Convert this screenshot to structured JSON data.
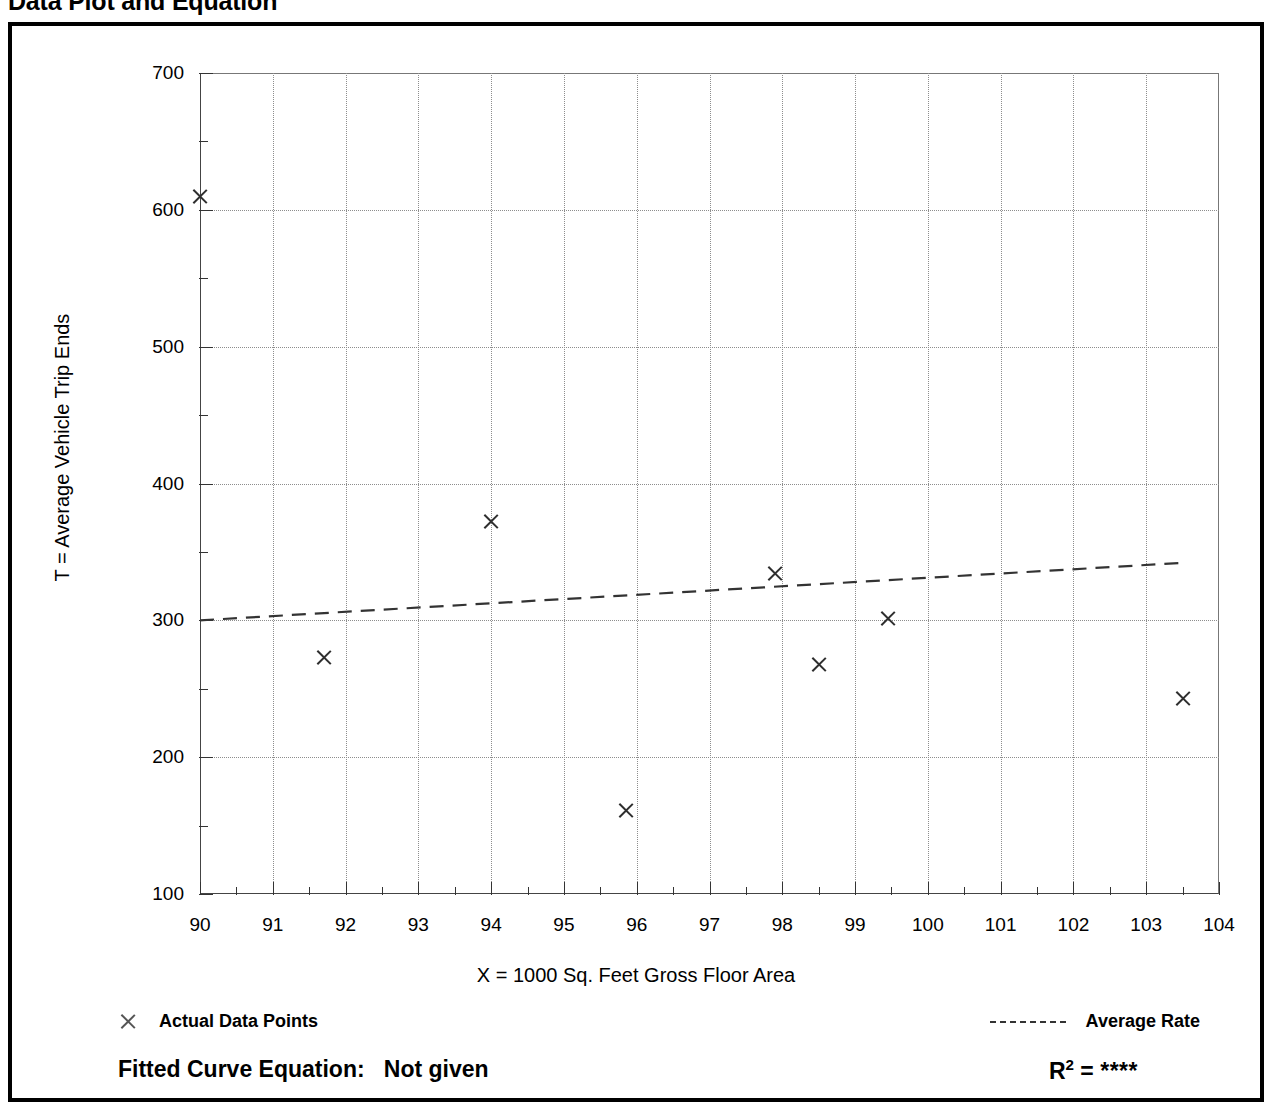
{
  "page": {
    "title": "Data Plot and Equation"
  },
  "chart_data": {
    "type": "scatter",
    "title": "Data Plot and Equation",
    "xlabel": "X = 1000 Sq. Feet Gross Floor Area",
    "ylabel": "T = Average Vehicle Trip Ends",
    "xlim": [
      90,
      104
    ],
    "ylim": [
      100,
      700
    ],
    "x_major_step": 1,
    "x_minor_step": 0.5,
    "y_major_step": 100,
    "y_minor_step": 50,
    "grid": true,
    "xticks": [
      90,
      91,
      92,
      93,
      94,
      95,
      96,
      97,
      98,
      99,
      100,
      101,
      102,
      103,
      104
    ],
    "yticks": [
      100,
      200,
      300,
      400,
      500,
      600,
      700
    ],
    "series": [
      {
        "name": "Actual Data Points",
        "marker": "x",
        "points": [
          {
            "x": 90.0,
            "y": 610
          },
          {
            "x": 91.7,
            "y": 273
          },
          {
            "x": 94.0,
            "y": 372
          },
          {
            "x": 95.85,
            "y": 161
          },
          {
            "x": 97.9,
            "y": 334
          },
          {
            "x": 98.5,
            "y": 268
          },
          {
            "x": 99.45,
            "y": 301
          },
          {
            "x": 103.5,
            "y": 243
          }
        ]
      },
      {
        "name": "Average Rate",
        "type": "line",
        "style": "dashed",
        "points": [
          {
            "x": 90.0,
            "y": 300
          },
          {
            "x": 103.5,
            "y": 342
          }
        ]
      }
    ],
    "legend": [
      {
        "label": "Actual Data Points",
        "marker": "x"
      },
      {
        "label": "Average Rate",
        "marker": "dashed-line"
      }
    ],
    "annotations": {
      "fitted_equation_label": "Fitted Curve Equation:",
      "fitted_equation_value": "Not given",
      "r_squared_label": "R",
      "r_squared_exponent": "2",
      "r_squared_equals": "=",
      "r_squared_value": "****"
    }
  }
}
